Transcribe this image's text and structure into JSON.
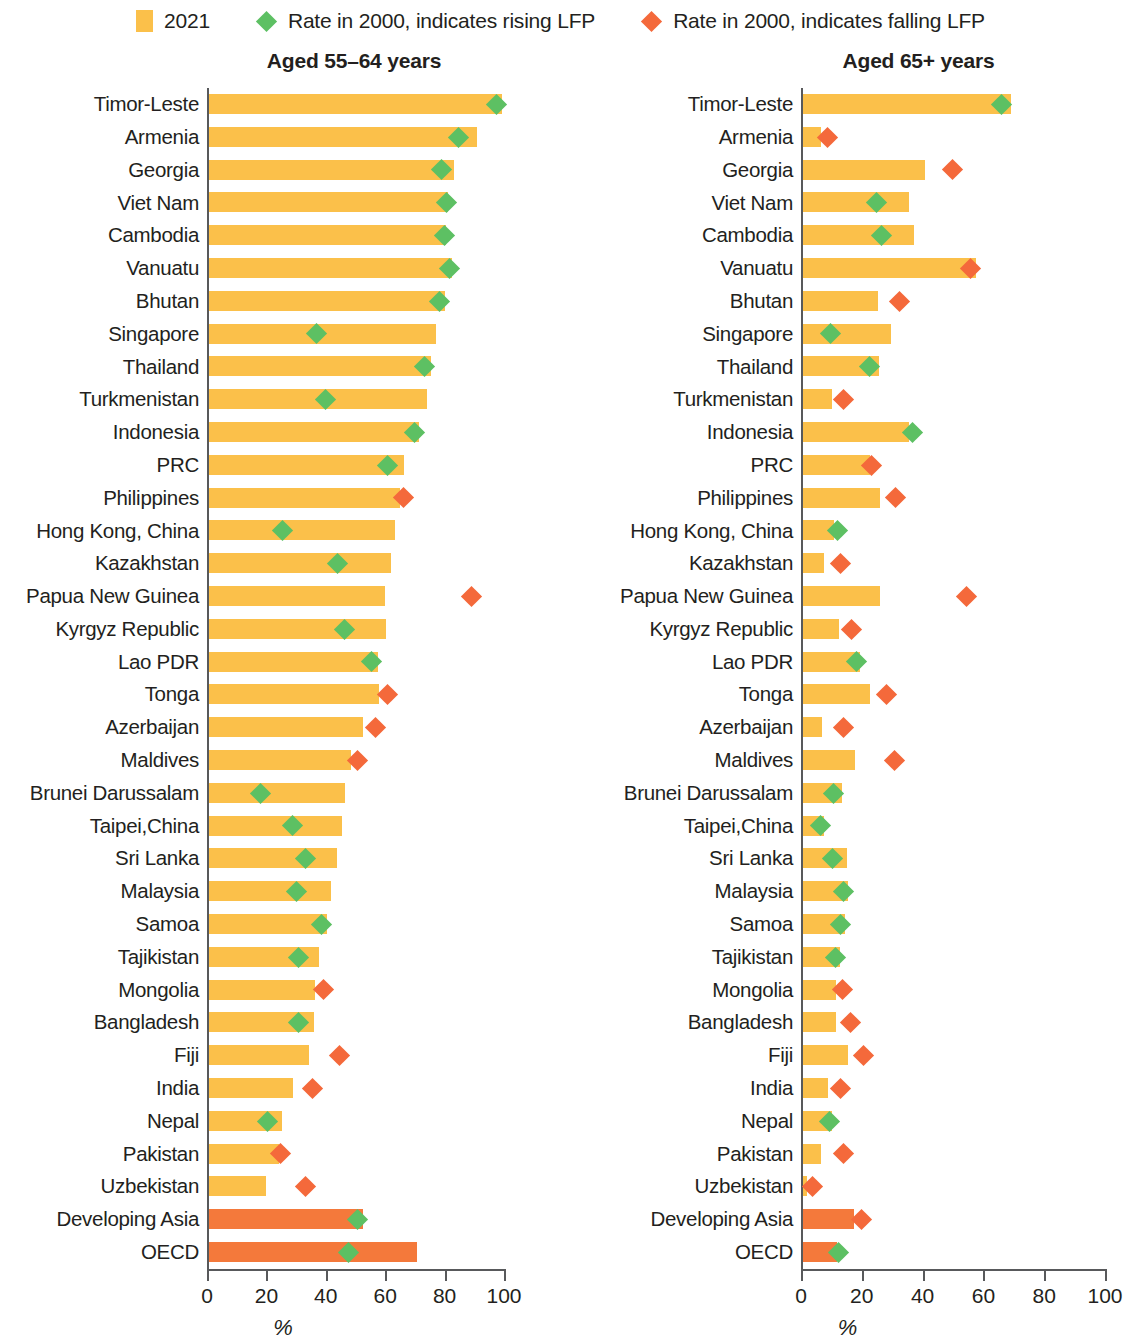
{
  "legend": {
    "items": [
      {
        "label": "2021",
        "icon": "bar-swatch",
        "color": "#fbc04a"
      },
      {
        "label": "Rate in 2000, indicates rising LFP",
        "icon": "diamond-marker",
        "color": "#5dc063"
      },
      {
        "label": "Rate in 2000, indicates falling LFP",
        "icon": "diamond-marker",
        "color": "#f4693b"
      }
    ]
  },
  "axis": {
    "ticks": [
      "0",
      "20",
      "40",
      "60",
      "80",
      "100"
    ],
    "caption": "%",
    "min": 0,
    "max": 100
  },
  "chart_data": [
    {
      "type": "bar",
      "title": "Aged 55–64 years",
      "xlabel": "%",
      "ylabel": "",
      "xlim": [
        0,
        100
      ],
      "grid": false,
      "legend_position": "top",
      "orientation": "horizontal",
      "categories": [
        "Timor-Leste",
        "Armenia",
        "Georgia",
        "Viet Nam",
        "Cambodia",
        "Vanuatu",
        "Bhutan",
        "Singapore",
        "Thailand",
        "Turkmenistan",
        "Indonesia",
        "PRC",
        "Philippines",
        "Hong Kong, China",
        "Kazakhstan",
        "Papua New Guinea",
        "Kyrgyz Republic",
        "Lao PDR",
        "Tonga",
        "Azerbaijan",
        "Maldives",
        "Brunei Darussalam",
        "Taipei,China",
        "Sri Lanka",
        "Malaysia",
        "Samoa",
        "Tajikistan",
        "Mongolia",
        "Bangladesh",
        "Fiji",
        "India",
        "Nepal",
        "Pakistan",
        "Uzbekistan",
        "Developing Asia",
        "OECD"
      ],
      "series": [
        {
          "name": "2021",
          "values": [
            82.0,
            75.0,
            68.5,
            67.0,
            66.5,
            68.0,
            66.2,
            63.5,
            62.2,
            61.1,
            58.8,
            54.5,
            53.5,
            52.0,
            51.0,
            49.3,
            49.7,
            47.3,
            47.6,
            43.2,
            39.9,
            38.2,
            37.2,
            35.8,
            34.1,
            33.1,
            30.7,
            29.7,
            29.4,
            28.0,
            23.5,
            20.5,
            19.5,
            16.0,
            43.2,
            58.4
          ]
        },
        {
          "name": "Rate in 2000",
          "values": [
            80.5,
            70.0,
            65.0,
            66.5,
            66.0,
            67.5,
            64.5,
            30.0,
            60.5,
            32.5,
            57.5,
            50.0,
            54.5,
            20.5,
            36.0,
            73.6,
            38.0,
            45.5,
            50.0,
            46.5,
            41.5,
            14.5,
            23.5,
            27.0,
            24.5,
            31.5,
            25.0,
            32.0,
            25.0,
            36.5,
            29.0,
            16.5,
            20.0,
            27.0,
            41.5,
            39.0
          ],
          "direction": [
            "rising",
            "rising",
            "rising",
            "rising",
            "rising",
            "rising",
            "rising",
            "rising",
            "rising",
            "rising",
            "rising",
            "rising",
            "falling",
            "rising",
            "rising",
            "falling",
            "rising",
            "rising",
            "falling",
            "falling",
            "falling",
            "rising",
            "rising",
            "rising",
            "rising",
            "rising",
            "rising",
            "falling",
            "rising",
            "falling",
            "falling",
            "rising",
            "falling",
            "falling",
            "rising",
            "rising"
          ]
        }
      ],
      "highlighted_categories": [
        "Developing Asia",
        "OECD"
      ]
    },
    {
      "type": "bar",
      "title": "Aged 65+ years",
      "xlabel": "%",
      "ylabel": "",
      "xlim": [
        0,
        100
      ],
      "grid": false,
      "legend_position": "top",
      "orientation": "horizontal",
      "categories": [
        "Timor-Leste",
        "Armenia",
        "Georgia",
        "Viet Nam",
        "Cambodia",
        "Vanuatu",
        "Bhutan",
        "Singapore",
        "Thailand",
        "Turkmenistan",
        "Indonesia",
        "PRC",
        "Philippines",
        "Hong Kong, China",
        "Kazakhstan",
        "Papua New Guinea",
        "Kyrgyz Republic",
        "Lao PDR",
        "Tonga",
        "Azerbaijan",
        "Maldives",
        "Brunei Darussalam",
        "Taipei,China",
        "Sri Lanka",
        "Malaysia",
        "Samoa",
        "Tajikistan",
        "Mongolia",
        "Bangladesh",
        "Fiji",
        "India",
        "Nepal",
        "Pakistan",
        "Uzbekistan",
        "Developing Asia",
        "OECD"
      ],
      "series": [
        {
          "name": "2021",
          "values": [
            63.8,
            5.6,
            37.5,
            32.6,
            34.0,
            53.0,
            23.0,
            27.0,
            23.4,
            8.9,
            32.6,
            20.7,
            23.7,
            9.5,
            6.3,
            23.7,
            11.0,
            17.5,
            20.7,
            5.9,
            16.0,
            12.0,
            6.3,
            13.5,
            13.8,
            13.0,
            11.5,
            10.2,
            10.2,
            13.8,
            7.6,
            8.9,
            5.6,
            1.3,
            15.5,
            10.5
          ]
        },
        {
          "name": "Rate in 2000",
          "values": [
            61.0,
            7.5,
            46.0,
            22.5,
            24.0,
            51.5,
            29.5,
            8.5,
            20.5,
            12.5,
            33.5,
            21.0,
            28.5,
            10.5,
            11.5,
            50.0,
            15.0,
            16.5,
            25.5,
            12.5,
            28.0,
            9.5,
            5.5,
            9.0,
            12.5,
            11.5,
            10.0,
            12.0,
            14.5,
            18.5,
            11.5,
            8.0,
            12.5,
            3.0,
            18.0,
            11.0
          ],
          "direction": [
            "rising",
            "falling",
            "falling",
            "rising",
            "rising",
            "falling",
            "falling",
            "rising",
            "rising",
            "falling",
            "rising",
            "falling",
            "falling",
            "rising",
            "falling",
            "falling",
            "falling",
            "rising",
            "falling",
            "falling",
            "falling",
            "rising",
            "rising",
            "rising",
            "rising",
            "rising",
            "rising",
            "falling",
            "falling",
            "falling",
            "falling",
            "rising",
            "falling",
            "falling",
            "falling",
            "rising"
          ]
        }
      ],
      "highlighted_categories": [
        "Developing Asia",
        "OECD"
      ]
    }
  ]
}
